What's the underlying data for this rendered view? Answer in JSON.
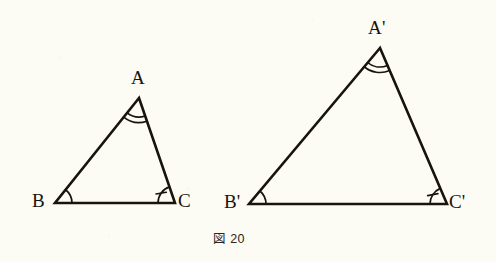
{
  "figure": {
    "caption": "図 20",
    "background_color": "#fdfcf4",
    "ink_color": "#171410"
  },
  "shapes": [
    {
      "id": "triangle-abc",
      "name": "small-triangle",
      "vertices": [
        {
          "label": "A",
          "x": 139,
          "y": 98,
          "label_x": 131,
          "label_y": 68,
          "marks": 2,
          "tick": false
        },
        {
          "label": "B",
          "x": 55,
          "y": 203,
          "label_x": 32,
          "label_y": 191,
          "marks": 1,
          "tick": false
        },
        {
          "label": "C",
          "x": 175,
          "y": 203,
          "label_x": 178,
          "label_y": 191,
          "marks": 1,
          "tick": true
        }
      ]
    },
    {
      "id": "triangle-abc-prime",
      "name": "large-triangle",
      "vertices": [
        {
          "label": "A'",
          "x": 380,
          "y": 48,
          "label_x": 368,
          "label_y": 18,
          "marks": 2,
          "tick": false
        },
        {
          "label": "B'",
          "x": 249,
          "y": 204,
          "label_x": 224,
          "label_y": 192,
          "marks": 1,
          "tick": false
        },
        {
          "label": "C'",
          "x": 447,
          "y": 204,
          "label_x": 449,
          "label_y": 192,
          "marks": 1,
          "tick": true
        }
      ]
    }
  ],
  "caption_position": {
    "x": 213,
    "y": 233
  }
}
